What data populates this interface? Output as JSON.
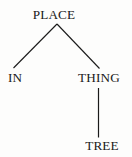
{
  "figure": {
    "kind": "syntax-tree-diagram",
    "ink_color": "#1a1a1a",
    "background_color": "#fdfdfc"
  },
  "tree": {
    "root": {
      "id": "place",
      "label": "PLACE"
    },
    "nodes": [
      {
        "id": "place",
        "label": "PLACE"
      },
      {
        "id": "in",
        "label": "IN"
      },
      {
        "id": "thing",
        "label": "THING"
      },
      {
        "id": "tree",
        "label": "TREE"
      }
    ],
    "edges": [
      {
        "from": "place",
        "to": "in",
        "style": "diagonal-left"
      },
      {
        "from": "place",
        "to": "thing",
        "style": "diagonal-right"
      },
      {
        "from": "thing",
        "to": "tree",
        "style": "vertical"
      }
    ]
  },
  "labels": {
    "place": "PLACE",
    "in": "IN",
    "thing": "THING",
    "tree": "TREE"
  }
}
